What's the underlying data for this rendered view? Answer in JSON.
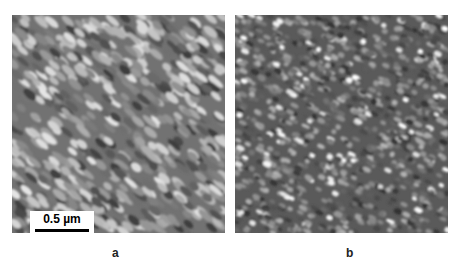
{
  "figure": {
    "panels": [
      {
        "id": "a",
        "label": "a",
        "description": "AFM micrograph with elongated diagonal grains",
        "scale_bar": "0.5 µm"
      },
      {
        "id": "b",
        "label": "b",
        "description": "AFM micrograph with small rounded bright grains"
      }
    ]
  }
}
